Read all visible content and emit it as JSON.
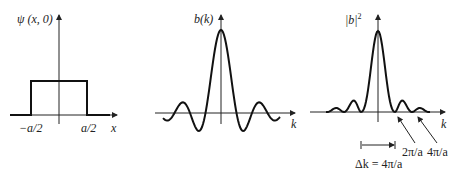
{
  "panels": [
    {
      "id": "wavefunction",
      "ylabel": "ψ (x, 0)",
      "xlabel": "x",
      "ticks": [
        "−a/2",
        "a/2"
      ]
    },
    {
      "id": "amplitude",
      "ylabel": "b(k)",
      "xlabel": "k"
    },
    {
      "id": "power",
      "ylabel": "|b|",
      "ylabel_sup": "2",
      "xlabel": "k",
      "annotations": [
        "2π/a",
        "4π/a"
      ],
      "width_label": "Δk = 4π/a"
    }
  ],
  "chart_data": [
    {
      "type": "line",
      "title": "",
      "xlabel": "x",
      "ylabel": "ψ (x, 0)",
      "description": "rectangular pulse from -a/2 to a/2",
      "x": [
        "−a/2",
        "a/2"
      ]
    },
    {
      "type": "line",
      "title": "",
      "xlabel": "k",
      "ylabel": "b(k)",
      "description": "sinc function with central peak and decaying side lobes"
    },
    {
      "type": "line",
      "title": "",
      "xlabel": "k",
      "ylabel": "|b|^2",
      "description": "sinc squared; zeros at ±2π/a, ±4π/a; Δk = 4π/a"
    }
  ]
}
